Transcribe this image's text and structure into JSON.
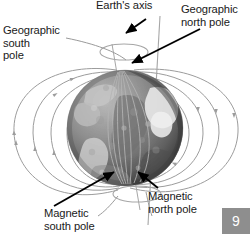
{
  "figure": {
    "background_color": "#ffffff",
    "labels": {
      "earths_axis": "Earth's axis",
      "geographic_north_pole": "Geographic\nnorth pole",
      "geographic_south_pole": "Geographic\nsouth\npole",
      "magnetic_south_pole": "Magnetic\nsouth pole",
      "magnetic_north_pole": "Magnetic\nnorth pole"
    },
    "clipped_edge_text": "=\n=\n⌐",
    "page_badge": {
      "number": "9",
      "background_color": "#8e8e8e",
      "text_color": "#ffffff"
    },
    "colors": {
      "label_text": "#1a1a1a",
      "pointer_arrow": "#000000",
      "leader_line": "#9a9a9a",
      "field_line": "#9c9c9c",
      "axis_line": "#a6a6a6",
      "globe_base": "#8a8a8a"
    },
    "elements": {
      "globe": "earth-globe-grayscale",
      "rotation_axis": "vertical-gray-axis-line",
      "axis_rings": "two-ellipse-rotation-indicators",
      "magnetic_axis": "tilted-magnetic-axis-line",
      "field_lines": "concentric-dipole-field-loops-with-direction-arrowheads"
    }
  }
}
